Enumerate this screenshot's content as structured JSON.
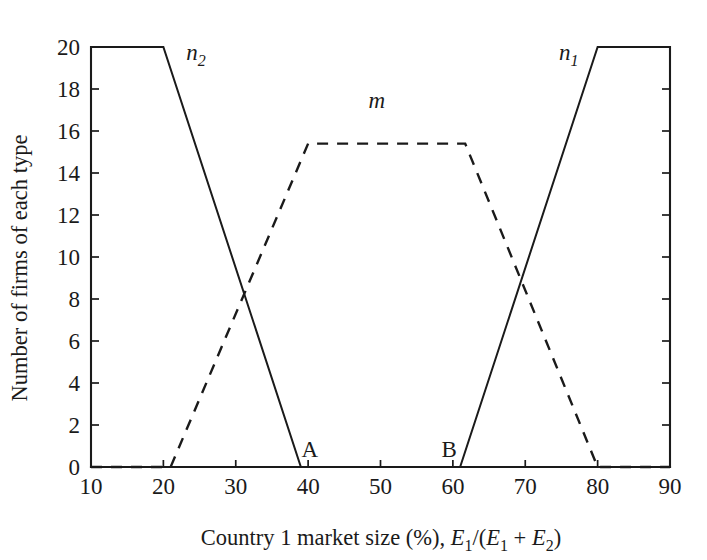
{
  "chart_data": {
    "type": "line",
    "title": "",
    "xlabel": "Country 1 market size (%), E1/(E1 + E2)",
    "ylabel": "Number of firms of each type",
    "xlim": [
      10,
      90
    ],
    "ylim": [
      0,
      20
    ],
    "grid": false,
    "legend_position": "inline-curve-labels",
    "xticks": [
      10,
      20,
      30,
      40,
      50,
      60,
      70,
      80,
      90
    ],
    "xtick_labels": [
      "10",
      "20",
      "30",
      "40",
      "50",
      "60",
      "70",
      "80",
      "90"
    ],
    "yticks": [
      0,
      2,
      4,
      6,
      8,
      10,
      12,
      14,
      16,
      18,
      20
    ],
    "ytick_labels": [
      "0",
      "2",
      "4",
      "6",
      "8",
      "10",
      "12",
      "14",
      "16",
      "18",
      "20"
    ],
    "series": [
      {
        "name": "n2",
        "label": "n",
        "label_sub": "2",
        "style": "solid",
        "label_x": 24.5,
        "label_y": 19.4,
        "points": [
          [
            10,
            20
          ],
          [
            20,
            20
          ],
          [
            39,
            0
          ],
          [
            90,
            0
          ]
        ]
      },
      {
        "name": "n1",
        "label": "n",
        "label_sub": "1",
        "style": "solid",
        "label_x": 76.0,
        "label_y": 19.4,
        "points": [
          [
            10,
            0
          ],
          [
            61,
            0
          ],
          [
            80,
            20
          ],
          [
            90,
            20
          ]
        ]
      },
      {
        "name": "m",
        "label": "m",
        "label_sub": "",
        "style": "dashed",
        "label_x": 49.5,
        "label_y": 17.1,
        "points": [
          [
            10,
            0
          ],
          [
            21,
            0
          ],
          [
            40,
            15.4
          ],
          [
            61.7,
            15.4
          ],
          [
            80,
            0
          ],
          [
            90,
            0
          ]
        ]
      }
    ],
    "annotations": [
      {
        "text": "A",
        "x": 39,
        "y": 0,
        "dx": 9,
        "dy": -10
      },
      {
        "text": "B",
        "x": 61,
        "y": 0,
        "dx": -11,
        "dy": -10
      }
    ],
    "xlabel_parts": {
      "lead": "Country 1 market size (%), ",
      "var1": "E",
      "sub1": "1",
      "slash": "/(",
      "var2": "E",
      "sub2": "1",
      "plus": " + ",
      "var3": "E",
      "sub3": "2",
      "close": ")"
    }
  },
  "colors": {
    "ink": "#1a1a1a",
    "background": "#ffffff"
  }
}
